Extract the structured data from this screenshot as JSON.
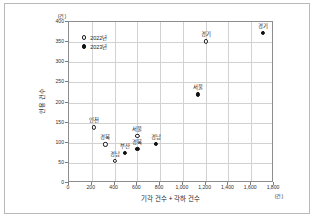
{
  "chart_data": {
    "type": "scatter",
    "title": "",
    "xlabel": "기각 건수 + 각하 건수",
    "ylabel": "인용 건수",
    "x_unit": "(건)",
    "y_unit": "(건)",
    "xlim": [
      0,
      1800
    ],
    "ylim": [
      0,
      400
    ],
    "xticks": [
      "0",
      "200",
      "400",
      "600",
      "800",
      "1,000",
      "1,200",
      "1,400",
      "1,600",
      "1,800"
    ],
    "xtick_values": [
      0,
      200,
      400,
      600,
      800,
      1000,
      1200,
      1400,
      1600,
      1800
    ],
    "yticks": [
      "0",
      "50",
      "100",
      "150",
      "200",
      "250",
      "300",
      "350",
      "400"
    ],
    "ytick_values": [
      0,
      50,
      100,
      150,
      200,
      250,
      300,
      350,
      400
    ],
    "grid": true,
    "legend_position": "top-left",
    "series": [
      {
        "name": "2022년",
        "marker": "open-circle",
        "color": "#1c1c1c",
        "points": [
          {
            "label": "인천",
            "x": 220,
            "y": 138,
            "label_pos": "top"
          },
          {
            "label": "경북",
            "x": 320,
            "y": 96,
            "label_pos": "top"
          },
          {
            "label": "경남",
            "x": 400,
            "y": 55,
            "label_pos": "top"
          },
          {
            "label": "서울",
            "x": 600,
            "y": 117,
            "label_pos": "top"
          },
          {
            "label": "경기",
            "x": 1200,
            "y": 352,
            "label_pos": "top"
          }
        ]
      },
      {
        "name": "2023년",
        "marker": "filled-circle",
        "color": "#111111",
        "points": [
          {
            "label": "부산",
            "x": 490,
            "y": 75,
            "label_pos": "top"
          },
          {
            "label": "경북",
            "x": 600,
            "y": 85,
            "label_pos": "top"
          },
          {
            "label": "경남",
            "x": 760,
            "y": 97,
            "label_pos": "top"
          },
          {
            "label": "서울",
            "x": 1130,
            "y": 220,
            "label_pos": "top"
          },
          {
            "label": "경기",
            "x": 1700,
            "y": 373,
            "label_pos": "top"
          }
        ]
      }
    ]
  }
}
